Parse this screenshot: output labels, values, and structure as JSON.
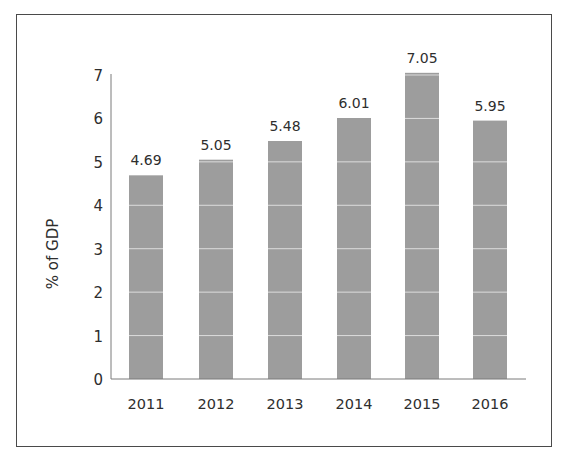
{
  "chart_data": {
    "type": "bar",
    "title": "",
    "xlabel": "",
    "ylabel": "% of GDP",
    "categories": [
      "2011",
      "2012",
      "2013",
      "2014",
      "2015",
      "2016"
    ],
    "values": [
      4.69,
      5.05,
      5.48,
      6.01,
      7.05,
      5.95
    ],
    "value_labels": [
      "4.69",
      "5.05",
      "5.48",
      "6.01",
      "7.05",
      "5.95"
    ],
    "ylim": [
      0,
      7
    ],
    "yticks": [
      0,
      1,
      2,
      3,
      4,
      5,
      6,
      7
    ],
    "grid": "horizontal gridlines visible only across bars",
    "legend": null,
    "colors": {
      "bar": "#9d9d9d",
      "gridline": "#dcdcdc",
      "axis": "#7a7a7a",
      "frame": "#4a4a4a"
    }
  }
}
